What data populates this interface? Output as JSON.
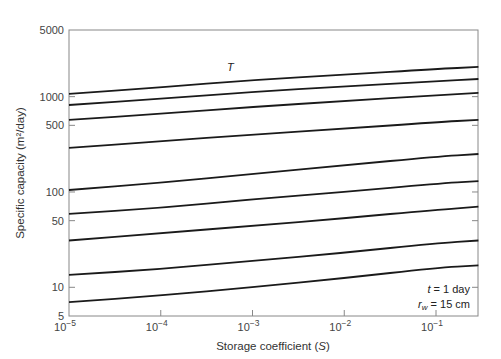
{
  "chart_data": {
    "type": "line",
    "title": "",
    "xlabel": "Storage coefficient (S)",
    "ylabel": "Specific capacity (m²/day)",
    "xscale": "log",
    "yscale": "log",
    "xlim": [
      1e-05,
      0.29
    ],
    "ylim": [
      5,
      5000
    ],
    "grid": false,
    "x_ticks": [
      {
        "value": 1e-05,
        "base": "10",
        "exp": "−5"
      },
      {
        "value": 0.0001,
        "base": "10",
        "exp": "−4"
      },
      {
        "value": 0.001,
        "base": "10",
        "exp": "−3"
      },
      {
        "value": 0.01,
        "base": "10",
        "exp": "−2"
      },
      {
        "value": 0.1,
        "base": "10",
        "exp": "−1"
      }
    ],
    "y_ticks": [
      5,
      10,
      50,
      100,
      500,
      1000,
      5000
    ],
    "x": [
      1e-05,
      0.0001,
      0.001,
      0.01,
      0.1,
      0.29
    ],
    "series": [
      {
        "name": "T = 2000 m²/day",
        "T": 2000,
        "values": [
          1070,
          1250,
          1500,
          1700,
          1950,
          2050
        ]
      },
      {
        "name": "T = 1500",
        "T": 1500,
        "values": [
          818,
          950,
          1120,
          1280,
          1450,
          1533
        ]
      },
      {
        "name": "T = 1000",
        "T": 1000,
        "values": [
          570,
          660,
          780,
          900,
          1030,
          1095
        ]
      },
      {
        "name": "T = 500",
        "T": 500,
        "values": [
          290,
          340,
          400,
          460,
          540,
          570
        ]
      },
      {
        "name": "T = 200",
        "T": 200,
        "values": [
          105,
          125,
          155,
          190,
          235,
          250
        ]
      },
      {
        "name": "T = 100",
        "T": 100,
        "values": [
          59,
          68,
          84,
          100,
          122,
          130
        ]
      },
      {
        "name": "T = 60",
        "T": 60,
        "values": [
          31,
          37,
          44,
          53,
          65,
          70
        ]
      },
      {
        "name": "T = 20",
        "T": 20,
        "values": [
          13.5,
          15.5,
          19,
          23,
          29,
          31
        ]
      },
      {
        "name": "T = 10",
        "T": 10,
        "values": [
          7,
          8.2,
          10,
          12.5,
          16,
          17
        ]
      }
    ],
    "annotations": [
      "t = 1 day",
      "rw = 15 cm"
    ]
  },
  "labels": {
    "xlabel_text": "Storage coefficient (",
    "xlabel_var": "S",
    "xlabel_close": ")",
    "ylabel": "Specific capacity (m²/day)",
    "note_t": " = 1 day",
    "note_rw": " = 15 cm",
    "curves": [
      {
        "T": "2000",
        "unit": " m²/day",
        "x": 227,
        "y": 71
      },
      {
        "T": "1500",
        "unit": "",
        "x": 236,
        "y": 91
      },
      {
        "T": "1000",
        "unit": "",
        "x": 236,
        "y": 104
      },
      {
        "T": "500",
        "unit": "",
        "x": 236,
        "y": 131
      },
      {
        "T": "200",
        "unit": "",
        "x": 236,
        "y": 169
      },
      {
        "T": "100",
        "unit": "",
        "x": 236,
        "y": 194
      },
      {
        "T": "60",
        "unit": "",
        "x": 236,
        "y": 221
      },
      {
        "T": "20",
        "unit": "",
        "x": 236,
        "y": 256
      },
      {
        "T": "10",
        "unit": "",
        "x": 236,
        "y": 283
      }
    ]
  }
}
